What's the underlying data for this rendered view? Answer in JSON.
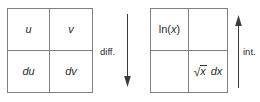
{
  "diagram": {
    "left_table": {
      "name": "generic-integration-by-parts-table",
      "cells": [
        {
          "id": "u",
          "text": "u",
          "style": "italic"
        },
        {
          "id": "v",
          "text": "v",
          "style": "italic"
        },
        {
          "id": "du",
          "text": "du",
          "style": "italic"
        },
        {
          "id": "dv",
          "text": "dv",
          "style": "italic"
        }
      ]
    },
    "right_table": {
      "name": "worked-example-table",
      "cells": [
        {
          "id": "lnx",
          "prefix": "ln(",
          "variable": "x",
          "suffix": ")"
        },
        {
          "id": "empty1",
          "text": ""
        },
        {
          "id": "empty2",
          "text": ""
        },
        {
          "id": "sqrtxdx",
          "radical": "√",
          "radicand": "x",
          "differential": "dx"
        }
      ]
    },
    "arrows": [
      {
        "id": "diff",
        "label": "diff.",
        "direction": "down"
      },
      {
        "id": "int",
        "label": "int.",
        "direction": "up"
      }
    ],
    "colors": {
      "stroke": "#808080",
      "text": "#2b2b2b",
      "arrow": "#3a3a3a",
      "background": "#ffffff"
    }
  }
}
